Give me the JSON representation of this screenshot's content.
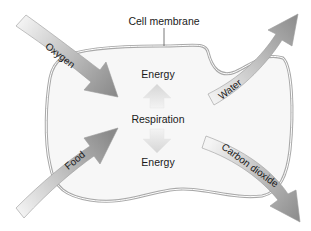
{
  "diagram": {
    "membrane_label": "Cell membrane",
    "center": {
      "top_label": "Energy",
      "middle_label": "Respiration",
      "bottom_label": "Energy"
    },
    "inputs": [
      {
        "label": "Oxygen",
        "direction": "in"
      },
      {
        "label": "Food",
        "direction": "in"
      }
    ],
    "outputs": [
      {
        "label": "Water",
        "direction": "out"
      },
      {
        "label": "Carbon dioxide",
        "direction": "out"
      }
    ],
    "colors": {
      "membrane_stroke": "#a8a8a8",
      "cell_fill": "#f6f6f6",
      "arrow_light": "#f2f2f2",
      "arrow_dark": "#8c8c8c",
      "energy_arrow": "#e3e3e3",
      "text": "#1a1a1a"
    }
  }
}
